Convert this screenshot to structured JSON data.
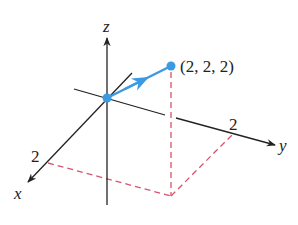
{
  "diagram": {
    "type": "3d-coordinate-axes-vector",
    "axes": {
      "x": {
        "label": "x",
        "tick_label": "2"
      },
      "y": {
        "label": "y",
        "tick_label": "2"
      },
      "z": {
        "label": "z"
      }
    },
    "point": {
      "label": "(2, 2, 2)",
      "coords": [
        2,
        2,
        2
      ]
    },
    "vector": {
      "from": [
        0,
        0,
        0
      ],
      "to": [
        2,
        2,
        2
      ]
    },
    "colors": {
      "axis": "#222222",
      "vector": "#3b9ae1",
      "dashed": "#d9536f"
    }
  }
}
